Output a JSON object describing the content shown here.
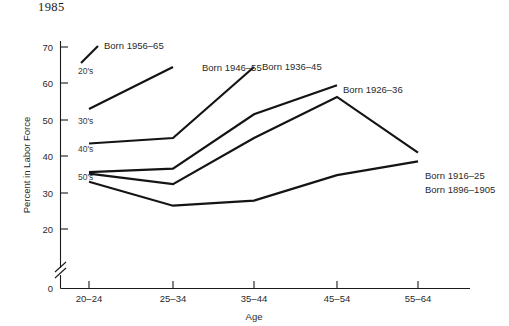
{
  "title": "1985",
  "chart_data": {
    "type": "line",
    "title": "1985",
    "xlabel": "Age",
    "ylabel": "Percent in Labor Force",
    "categories": [
      "20–24",
      "25–34",
      "35–44",
      "45–54",
      "55–64"
    ],
    "yticks": [
      0,
      20,
      30,
      40,
      50,
      60,
      70
    ],
    "ylim": [
      0,
      74
    ],
    "axis_break": true,
    "grid": false,
    "legend": "inline-end-labels",
    "series": [
      {
        "name": "Born 1956–65",
        "label": "Born 1956–65",
        "decade_label": "20's",
        "x": [
          "20–24"
        ],
        "values": [
          70.0
        ],
        "segment": {
          "x1": 81,
          "y1": 63,
          "x2": 98,
          "y2": 46
        }
      },
      {
        "name": "Born 1946–55",
        "label": "Born 1946–55",
        "decade_label": "30's",
        "x": [
          "20–24",
          "25–34"
        ],
        "values": [
          53.0,
          64.5
        ]
      },
      {
        "name": "Born 1936–45",
        "label": "Born 1936–45",
        "decade_label": "40's",
        "x": [
          "20–24",
          "25–34",
          "35–44"
        ],
        "values": [
          43.5,
          45.0,
          64.5
        ]
      },
      {
        "name": "Born 1926–36",
        "label": "Born 1926–36",
        "decade_label": "50's",
        "x": [
          "20–24",
          "25–34",
          "35–44",
          "45–54"
        ],
        "values": [
          35.6,
          36.6,
          51.5,
          59.5
        ]
      },
      {
        "name": "Born 1916–25",
        "label": "Born 1916–25",
        "decade_label": "",
        "x": [
          "20–24",
          "25–34",
          "35–44",
          "45–54",
          "55–64"
        ],
        "values": [
          35.2,
          32.3,
          45.0,
          56.3,
          41.0
        ]
      },
      {
        "name": "Born 1896–1905",
        "label": "Born 1896–1905",
        "decade_label": "",
        "x": [
          "20–24",
          "25–34",
          "35–44",
          "45–54",
          "55–64"
        ],
        "values": [
          33.0,
          26.4,
          27.8,
          34.8,
          38.6
        ]
      }
    ],
    "annotations": [
      {
        "text": "20's",
        "x": 78,
        "y": 74
      },
      {
        "text": "30's",
        "x": 78,
        "y": 124
      },
      {
        "text": "40's",
        "x": 78,
        "y": 152
      },
      {
        "text": "50's",
        "x": 78,
        "y": 180
      }
    ],
    "series_label_positions": [
      {
        "text": "Born 1956–65",
        "x": 104,
        "y": 49
      },
      {
        "text": "Born 1946–55",
        "x": 202,
        "y": 71
      },
      {
        "text": "Born 1936–45",
        "x": 262,
        "y": 70
      },
      {
        "text": "Born 1926–36",
        "x": 343,
        "y": 93
      },
      {
        "text": "Born 1916–25",
        "x": 425,
        "y": 179
      },
      {
        "text": "Born 1896–1905",
        "x": 425,
        "y": 193
      }
    ]
  },
  "axis": {
    "y_tick_labels": [
      "70",
      "60",
      "50",
      "40",
      "30",
      "20",
      "0"
    ],
    "x_tick_labels": [
      "20–24",
      "25–34",
      "35–44",
      "45–54",
      "55–64"
    ],
    "x_title": "Age",
    "y_title": "Percent in Labor Force"
  }
}
